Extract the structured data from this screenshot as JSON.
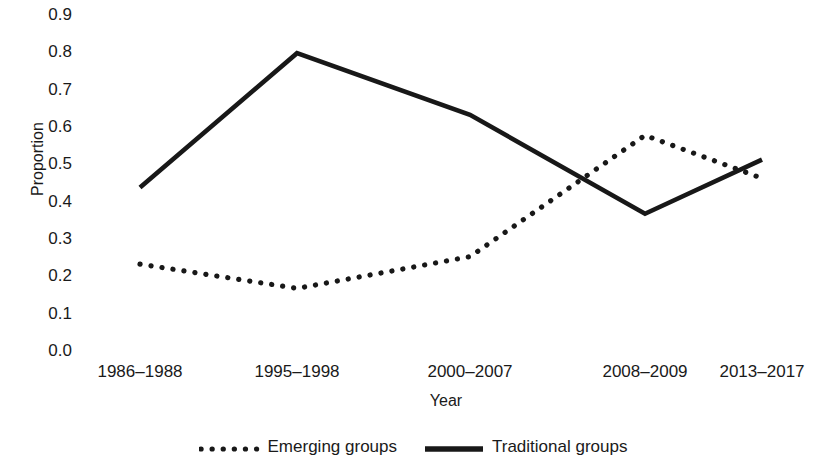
{
  "chart_data": {
    "type": "line",
    "title": "",
    "xlabel": "Year",
    "ylabel": "Proportion",
    "categories": [
      "1986–1988",
      "1995–1998",
      "2000–2007",
      "2008–2009",
      "2013–2017"
    ],
    "series": [
      {
        "name": "Emerging groups",
        "style": "dotted",
        "color": "#181818",
        "values": [
          0.23,
          0.165,
          0.25,
          0.575,
          0.46
        ]
      },
      {
        "name": "Traditional groups",
        "style": "solid",
        "color": "#181818",
        "values": [
          0.435,
          0.795,
          0.63,
          0.365,
          0.51
        ]
      }
    ],
    "ylim": [
      0.0,
      0.9
    ],
    "yticks": [
      "0.0",
      "0.1",
      "0.2",
      "0.3",
      "0.4",
      "0.5",
      "0.6",
      "0.7",
      "0.8",
      "0.9"
    ],
    "ytick_values": [
      0.0,
      0.1,
      0.2,
      0.3,
      0.4,
      0.5,
      0.6,
      0.7,
      0.8,
      0.9
    ],
    "grid": false,
    "legend_position": "bottom"
  },
  "axes": {
    "y_title": "Proportion",
    "x_title": "Year"
  },
  "legend": {
    "entries": [
      {
        "label": "Emerging groups"
      },
      {
        "label": "Traditional groups"
      }
    ]
  }
}
